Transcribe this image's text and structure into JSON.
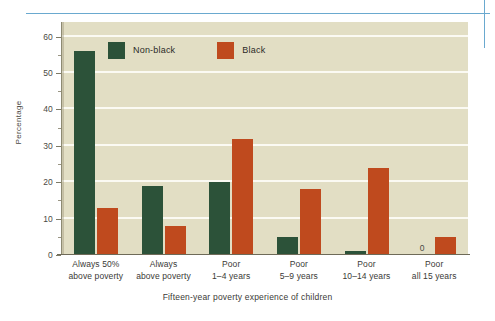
{
  "figure": {
    "title": "",
    "y_axis_title": "Percentage",
    "x_axis_title": "Fifteen-year poverty experience of children",
    "colors": {
      "nonblack": "#2c5239",
      "black": "#bf4a1e",
      "panel_background": "#e2dec4",
      "gridline": "#fbfaf3",
      "crop_mark": "#6aa9cf"
    },
    "legend": {
      "entries": [
        {
          "label": "Non-black",
          "color_key": "nonblack"
        },
        {
          "label": "Black",
          "color_key": "black"
        }
      ]
    },
    "y_ticks": [
      "0",
      "10",
      "20",
      "30",
      "40",
      "50",
      "60"
    ]
  },
  "chart_data": {
    "type": "bar",
    "title": "",
    "xlabel": "Fifteen-year poverty experience of children",
    "ylabel": "Percentage",
    "ylim": [
      0,
      64
    ],
    "yticks": [
      0,
      10,
      20,
      30,
      40,
      50,
      60
    ],
    "grid": true,
    "legend_position": "top-left-inside",
    "categories": [
      "Always 50% above poverty",
      "Always above poverty",
      "Poor 1–4 years",
      "Poor 5–9 years",
      "Poor 10–14 years",
      "Poor all 15 years"
    ],
    "category_lines": [
      [
        "Always 50%",
        "above poverty"
      ],
      [
        "Always",
        "above poverty"
      ],
      [
        "Poor",
        "1–4 years"
      ],
      [
        "Poor",
        "5–9 years"
      ],
      [
        "Poor",
        "10–14 years"
      ],
      [
        "Poor",
        "all 15 years"
      ]
    ],
    "series": [
      {
        "name": "Non-black",
        "color": "#2c5239",
        "values": [
          56,
          19,
          20,
          5,
          1,
          0
        ]
      },
      {
        "name": "Black",
        "color": "#bf4a1e",
        "values": [
          13,
          8,
          32,
          18,
          24,
          5
        ]
      }
    ],
    "data_labels": [
      {
        "series": "Non-black",
        "category": "Poor all 15 years",
        "text": "0"
      }
    ]
  }
}
